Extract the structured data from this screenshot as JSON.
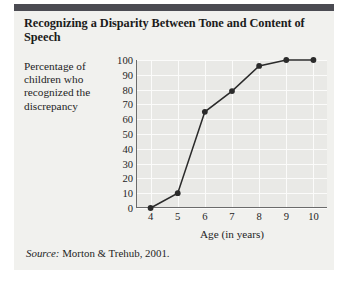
{
  "figure": {
    "title": "Recognizing a Disparity Between Tone and Content of Speech",
    "source_prefix": "Source:",
    "source_text": " Morton & Trehub, 2001.",
    "accent_bar_color": "#4b4b52",
    "panel_color": "#f1f1ee",
    "plot_bg_color": "#e9e9e6",
    "gridline_color": "#fbfbfa",
    "axis_color": "#6b6b6b",
    "series_color": "#2b2b2b"
  },
  "chart_data": {
    "type": "line",
    "title": "Recognizing a Disparity Between Tone and Content of Speech",
    "xlabel": "Age (in years)",
    "ylabel": "Percentage of children who recognized the discrepancy",
    "categories": [
      4,
      5,
      6,
      7,
      8,
      9,
      10
    ],
    "x_tick_labels": [
      "4",
      "5",
      "6",
      "7",
      "8",
      "9",
      "10"
    ],
    "values": [
      0,
      10,
      65,
      79,
      96,
      100,
      100
    ],
    "y_tick_labels": [
      "0",
      "10",
      "20",
      "30",
      "40",
      "50",
      "60",
      "70",
      "80",
      "90",
      "100"
    ],
    "y_ticks": [
      0,
      10,
      20,
      30,
      40,
      50,
      60,
      70,
      80,
      90,
      100
    ],
    "ylim": [
      0,
      100
    ],
    "xlim": [
      3.5,
      10.5
    ],
    "grid": true,
    "legend": "none",
    "marker": "filled-circle",
    "series": [
      {
        "name": "Percentage of children who recognized the discrepancy",
        "values": [
          0,
          10,
          65,
          79,
          96,
          100,
          100
        ]
      }
    ]
  }
}
